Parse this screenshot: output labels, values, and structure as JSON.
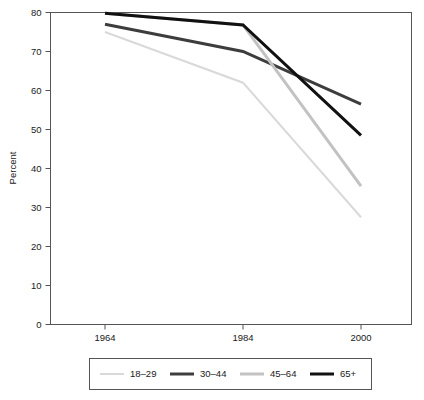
{
  "chart_data": {
    "type": "line",
    "title": "",
    "xlabel": "",
    "ylabel": "Percent",
    "x": [
      "1964",
      "1984",
      "2000"
    ],
    "categories": [
      "1964",
      "1984",
      "2000"
    ],
    "ylim": [
      0,
      80
    ],
    "yticks": [
      0,
      10,
      20,
      30,
      40,
      50,
      60,
      70,
      80
    ],
    "ytick_labels": [
      "0",
      "10",
      "20",
      "30",
      "40",
      "50",
      "60",
      "70",
      "80"
    ],
    "xtick_labels": [
      "1964",
      "1984",
      "2000"
    ],
    "grid": false,
    "legend_position": "bottom",
    "series": [
      {
        "name": "18–29",
        "values": [
          75.0,
          62.0,
          27.5
        ],
        "color": "#d9d9d9",
        "width": 2.0
      },
      {
        "name": "30–44",
        "values": [
          77.0,
          70.0,
          56.5
        ],
        "color": "#3d3d3d",
        "width": 3.0
      },
      {
        "name": "45–64",
        "values": [
          79.8,
          76.8,
          35.5
        ],
        "color": "#c2c2c2",
        "width": 3.0
      },
      {
        "name": "65+",
        "values": [
          79.8,
          76.8,
          48.5
        ],
        "color": "#111111",
        "width": 3.0
      }
    ]
  },
  "axes": {
    "y_title": "Percent",
    "y_ticks": [
      {
        "label": "80",
        "value": 80
      },
      {
        "label": "70",
        "value": 70
      },
      {
        "label": "60",
        "value": 60
      },
      {
        "label": "50",
        "value": 50
      },
      {
        "label": "40",
        "value": 40
      },
      {
        "label": "30",
        "value": 30
      },
      {
        "label": "20",
        "value": 20
      },
      {
        "label": "10",
        "value": 10
      },
      {
        "label": "0",
        "value": 0
      }
    ],
    "x_ticks": [
      {
        "label": "1964"
      },
      {
        "label": "1984"
      },
      {
        "label": "2000"
      }
    ]
  },
  "legend": {
    "entries": [
      {
        "label": "18–29",
        "color": "#d9d9d9",
        "width": 2.0
      },
      {
        "label": "30–44",
        "color": "#3d3d3d",
        "width": 3.0
      },
      {
        "label": "45–64",
        "color": "#c2c2c2",
        "width": 3.0
      },
      {
        "label": "65+",
        "color": "#111111",
        "width": 3.0
      }
    ]
  },
  "colors": {
    "frame": "#555555",
    "text": "#1a1a1a",
    "background": "#ffffff"
  }
}
